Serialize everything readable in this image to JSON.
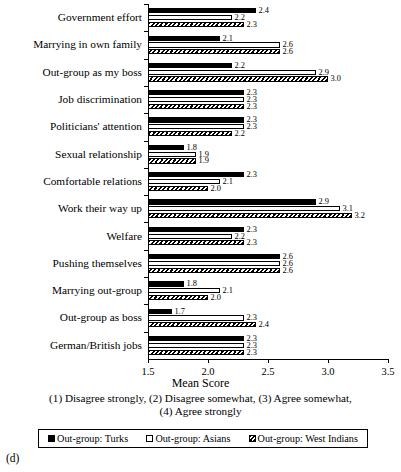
{
  "panel_id": "(d)",
  "chart_data": {
    "type": "bar",
    "orientation": "horizontal",
    "title": "",
    "xlabel": "Mean Score",
    "ylabel": "",
    "xlim": [
      1.5,
      3.5
    ],
    "xticks": [
      "1.5",
      "2.0",
      "2.5",
      "3.0",
      "3.5"
    ],
    "xtick_values": [
      1.5,
      2.0,
      2.5,
      3.0,
      3.5
    ],
    "grid": false,
    "legend_position": "bottom",
    "categories": [
      "Government effort",
      "Marrying in own family",
      "Out-group as my boss",
      "Job discrimination",
      "Politicians' attention",
      "Sexual relationship",
      "Comfortable relations",
      "Work their way up",
      "Welfare",
      "Pushing themselves",
      "Marrying out-group",
      "Out-group as boss",
      "German/British jobs"
    ],
    "series": [
      {
        "name": "Out-group: Turks",
        "fill": "solid-black",
        "values": [
          2.4,
          2.1,
          2.2,
          2.3,
          2.3,
          1.8,
          2.3,
          2.9,
          2.3,
          2.6,
          1.8,
          1.7,
          2.3
        ],
        "labels": [
          "2.4",
          "2.1",
          "2.2",
          "2.3",
          "2.3",
          "1.8",
          "2.3",
          "2.9",
          "2.3",
          "2.6",
          "1.8",
          "1.7",
          "2.3"
        ]
      },
      {
        "name": "Out-group: Asians",
        "fill": "white",
        "values": [
          2.2,
          2.6,
          2.9,
          2.3,
          2.3,
          1.9,
          2.1,
          3.1,
          2.2,
          2.6,
          2.1,
          2.3,
          2.3
        ],
        "labels": [
          "2.2",
          "2.6",
          "2.9",
          "2.3",
          "2.3",
          "1.9",
          "2.1",
          "3.1",
          "2.2",
          "2.6",
          "2.1",
          "2.3",
          "2.3"
        ]
      },
      {
        "name": "Out-group: West Indians",
        "fill": "hatched",
        "values": [
          2.3,
          2.6,
          3.0,
          2.3,
          2.2,
          1.9,
          2.0,
          3.2,
          2.3,
          2.6,
          2.0,
          2.4,
          2.3
        ],
        "labels": [
          "2.3",
          "2.6",
          "3.0",
          "2.3",
          "2.2",
          "1.9",
          "2.0",
          "3.2",
          "2.3",
          "2.6",
          "2.0",
          "2.4",
          "2.3"
        ]
      }
    ],
    "caption_lines": [
      "(1) Disagree strongly, (2) Disagree somewhat, (3) Agree somewhat,",
      "(4) Agree strongly"
    ]
  }
}
